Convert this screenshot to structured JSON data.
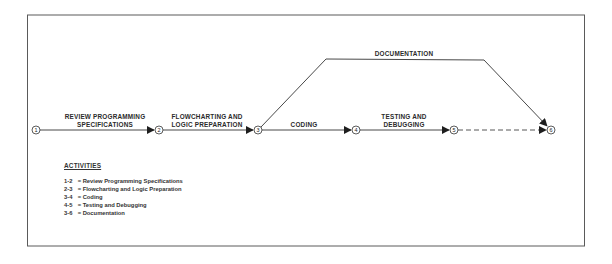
{
  "diagram": {
    "type": "PERT network",
    "nodes": [
      {
        "id": "1",
        "label": "1"
      },
      {
        "id": "2",
        "label": "2"
      },
      {
        "id": "3",
        "label": "3"
      },
      {
        "id": "4",
        "label": "4"
      },
      {
        "id": "5",
        "label": "5"
      },
      {
        "id": "6",
        "label": "6"
      }
    ],
    "edges": [
      {
        "from": "1",
        "to": "2",
        "label_line1": "REVIEW PROGRAMMING",
        "label_line2": "SPECIFICATIONS",
        "style": "solid"
      },
      {
        "from": "2",
        "to": "3",
        "label_line1": "FLOWCHARTING AND",
        "label_line2": "LOGIC PREPARATION",
        "style": "solid"
      },
      {
        "from": "3",
        "to": "4",
        "label_line1": "CODING",
        "style": "solid"
      },
      {
        "from": "4",
        "to": "5",
        "label_line1": "TESTING AND",
        "label_line2": "DEBUGGING",
        "style": "solid"
      },
      {
        "from": "5",
        "to": "6",
        "style": "dashed"
      },
      {
        "from": "3",
        "to": "6",
        "label_line1": "DOCUMENTATION",
        "style": "solid"
      }
    ]
  },
  "legend": {
    "title": "ACTIVITIES",
    "items": [
      {
        "code": "1-2",
        "sep": "=",
        "text": "Review Programming Specifications"
      },
      {
        "code": "2-3",
        "sep": "=",
        "text": "Flowcharting and Logic Preparation"
      },
      {
        "code": "3-4",
        "sep": "=",
        "text": "Coding"
      },
      {
        "code": "4-5",
        "sep": "=",
        "text": "Testing and Debugging"
      },
      {
        "code": "3-6",
        "sep": "=",
        "text": "Documentation"
      }
    ]
  },
  "colors": {
    "line": "#333333",
    "frame": "#555555",
    "background": "#ffffff"
  }
}
